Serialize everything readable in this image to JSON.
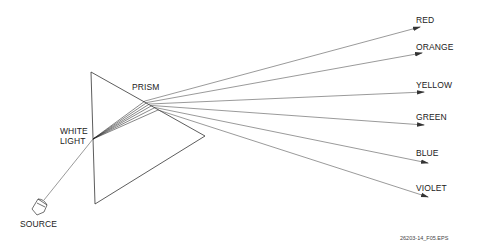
{
  "diagram": {
    "labels": {
      "prism": "PRISM",
      "white_light_line1": "WHITE",
      "white_light_line2": "LIGHT",
      "source": "SOURCE"
    },
    "colors": [
      {
        "name": "RED",
        "label": "RED"
      },
      {
        "name": "ORANGE",
        "label": "ORANGE"
      },
      {
        "name": "YELLOW",
        "label": "YELLOW"
      },
      {
        "name": "GREEN",
        "label": "GREEN"
      },
      {
        "name": "BLUE",
        "label": "BLUE"
      },
      {
        "name": "VIOLET",
        "label": "VIOLET"
      }
    ],
    "figure_id": "26203-14_F05.EPS",
    "stroke_color": "#333333"
  }
}
